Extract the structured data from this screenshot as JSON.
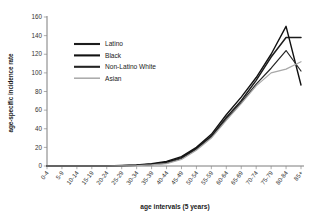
{
  "chart_data": {
    "type": "line",
    "title": "",
    "xlabel": "age intervals (5 years)",
    "ylabel": "age-specific incidence rate",
    "categories": [
      "0-4",
      "5-9",
      "10-14",
      "15-19",
      "20-24",
      "25-29",
      "30-34",
      "35-39",
      "40-44",
      "45-49",
      "50-54",
      "55-59",
      "60-64",
      "65-69",
      "70-74",
      "75-79",
      "80-84",
      "85+"
    ],
    "ylim": [
      0,
      160
    ],
    "yticks": [
      0,
      20,
      40,
      60,
      80,
      100,
      120,
      140,
      160
    ],
    "grid": false,
    "legend_position": "upper-left-inside",
    "series": [
      {
        "name": "Latino",
        "color": "#1c1c1c",
        "width": 1.5,
        "values": [
          0,
          0,
          0,
          0,
          0,
          0.4,
          0.8,
          2,
          4,
          9,
          19,
          32,
          52,
          70,
          92,
          117,
          138,
          138
        ]
      },
      {
        "name": "Black",
        "color": "#111111",
        "width": 1.4,
        "values": [
          0,
          0,
          0,
          0,
          0,
          0.5,
          1.2,
          2.5,
          5,
          10,
          20,
          34,
          55,
          74,
          95,
          120,
          150,
          87
        ]
      },
      {
        "name": "Non-Latino White",
        "color": "#242424",
        "width": 1.2,
        "values": [
          0,
          0,
          0,
          0,
          0,
          0.3,
          0.7,
          1.5,
          3,
          8,
          18,
          31,
          50,
          68,
          88,
          105,
          124,
          102
        ]
      },
      {
        "name": "Asian",
        "color": "#a8a8a8",
        "width": 1.2,
        "values": [
          0,
          0,
          0,
          0,
          0,
          0.2,
          0.5,
          1.2,
          2.5,
          7,
          17,
          30,
          49,
          67,
          86,
          100,
          104,
          112
        ]
      }
    ]
  },
  "legend": {
    "items": [
      {
        "label": "Latino"
      },
      {
        "label": "Black"
      },
      {
        "label": "Non-Latino White"
      },
      {
        "label": "Asian"
      }
    ]
  }
}
